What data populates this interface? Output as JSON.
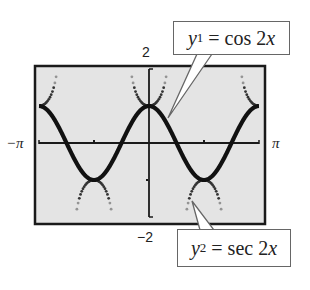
{
  "chart_data": {
    "type": "line",
    "title": "",
    "xlabel": "",
    "ylabel": "",
    "xlim": [
      -3.14159,
      3.14159
    ],
    "ylim": [
      -2,
      2
    ],
    "x_tick_labels": {
      "left": "−π",
      "right": "π"
    },
    "y_tick_labels": {
      "top": "2",
      "bottom": "−2"
    },
    "x_ticks": [
      -1.5708,
      1.5708
    ],
    "y_ticks": [
      -1,
      1
    ],
    "grid": false,
    "legend": "callouts",
    "series": [
      {
        "name": "y1 = cos 2x",
        "function": "cos(2x)",
        "style": "solid-thick",
        "color": "#111111",
        "key_points": [
          {
            "x": -3.14159,
            "y": 1
          },
          {
            "x": -2.3562,
            "y": 0
          },
          {
            "x": -1.5708,
            "y": -1
          },
          {
            "x": -0.7854,
            "y": 0
          },
          {
            "x": 0,
            "y": 1
          },
          {
            "x": 0.7854,
            "y": 0
          },
          {
            "x": 1.5708,
            "y": -1
          },
          {
            "x": 2.3562,
            "y": 0
          },
          {
            "x": 3.14159,
            "y": 1
          }
        ]
      },
      {
        "name": "y2 = sec 2x",
        "function": "sec(2x)",
        "style": "dotted",
        "color": "#333333",
        "key_points": [
          {
            "x": -3.14159,
            "y": 1
          },
          {
            "x": -1.5708,
            "y": -1
          },
          {
            "x": 0,
            "y": 1
          },
          {
            "x": 1.5708,
            "y": -1
          },
          {
            "x": 3.14159,
            "y": 1
          }
        ],
        "asymptotes": [
          -2.3562,
          -0.7854,
          0.7854,
          2.3562
        ]
      }
    ]
  },
  "labels": {
    "y_max": "2",
    "y_min": "−2",
    "x_min": "−π",
    "x_max": "π"
  },
  "callouts": {
    "y1": {
      "var": "y",
      "sub": "1",
      "rest": " = cos 2",
      "xvar": "x"
    },
    "y2": {
      "var": "y",
      "sub": "2",
      "rest": " = sec 2",
      "xvar": "x"
    }
  },
  "colors": {
    "plot_background": "#e4e4e4",
    "frame": "#1a1a1a",
    "axis": "#1a1a1a",
    "curve": "#111111"
  }
}
